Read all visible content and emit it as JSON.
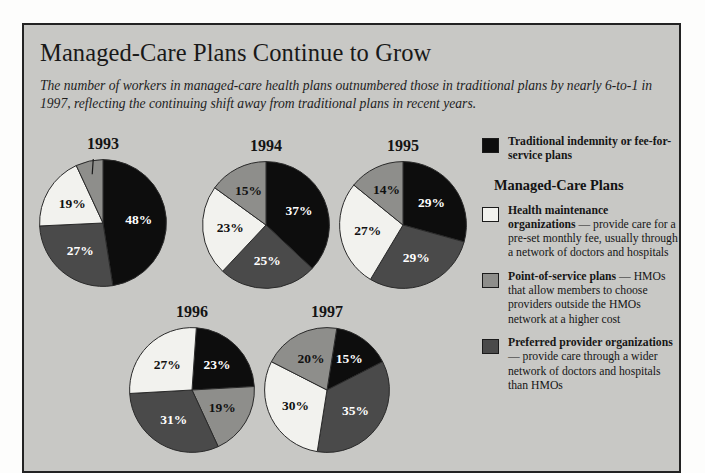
{
  "header": {
    "title": "Managed-Care Plans Continue to Grow",
    "subtitle": "The number of workers in managed-care health plans outnumbered those in traditional plans by nearly 6-to-1 in 1997, reflecting the continuing shift away from traditional plans in recent years."
  },
  "colors": {
    "background": "#c8c8c5",
    "frame_border": "#232323",
    "traditional": "#0d0d0d",
    "hmo": "#f2f2ee",
    "pos": "#8e8e8b",
    "ppo": "#4a4a4a",
    "label_on_dark": "#ffffff",
    "label_on_light": "#111111"
  },
  "legend": {
    "managed_care_heading": "Managed-Care Plans",
    "items": [
      {
        "key": "traditional",
        "swatch": "#0d0d0d",
        "bold": "Traditional indemnity or fee-for-service plans",
        "rest": ""
      },
      {
        "key": "hmo",
        "swatch": "#f2f2ee",
        "bold": "Health maintenance organizations",
        "rest": " — provide care for a pre-set monthly fee, usually through a network of doctors and hospitals"
      },
      {
        "key": "pos",
        "swatch": "#8e8e8b",
        "bold": "Point-of-service plans",
        "rest": " — HMOs that allow members to choose providers outside the HMOs network at a higher cost"
      },
      {
        "key": "ppo",
        "swatch": "#4a4a4a",
        "bold": "Preferred provider organizations",
        "rest": " — provide care through a wider network of doctors and hospitals than HMOs"
      }
    ]
  },
  "chart_data": {
    "type": "pie",
    "title": "Managed-Care Plans Continue to Grow",
    "subtitle": "The number of workers in managed-care health plans outnumbered those in traditional plans by nearly 6-to-1 in 1997, reflecting the continuing shift away from traditional plans in recent years.",
    "unit": "percent of workers",
    "categories": [
      "Traditional indemnity or fee-for-service plans",
      "Preferred provider organizations",
      "Health maintenance organizations",
      "Point-of-service plans"
    ],
    "category_colors": [
      "#0d0d0d",
      "#4a4a4a",
      "#f2f2ee",
      "#8e8e8b"
    ],
    "charts": [
      {
        "year": "1993",
        "start_angle": 0,
        "slices": [
          {
            "key": "traditional",
            "label": "48%",
            "value": 48,
            "color": "#0d0d0d",
            "label_color": "on-dark",
            "lx": 50.0,
            "ly": 50.0
          },
          {
            "key": "ppo",
            "label": "27%",
            "value": 27,
            "color": "#4a4a4a",
            "label_color": "on-dark",
            "lx": 50.0,
            "ly": 50.0
          },
          {
            "key": "hmo",
            "label": "19%",
            "value": 19,
            "color": "#f2f2ee",
            "label_color": "on-light",
            "lx": 50.0,
            "ly": 50.0
          },
          {
            "key": "pos",
            "label": "7%",
            "value": 7,
            "color": "#8e8e8b",
            "label_color": "on-light",
            "callout": true
          }
        ]
      },
      {
        "year": "1994",
        "start_angle": 0,
        "slices": [
          {
            "key": "traditional",
            "label": "37%",
            "value": 37,
            "color": "#0d0d0d",
            "label_color": "on-dark",
            "lx": 50.0,
            "ly": 50.0
          },
          {
            "key": "ppo",
            "label": "25%",
            "value": 25,
            "color": "#4a4a4a",
            "label_color": "on-dark",
            "lx": 50.0,
            "ly": 50.0
          },
          {
            "key": "hmo",
            "label": "23%",
            "value": 23,
            "color": "#f2f2ee",
            "label_color": "on-light",
            "lx": 50.0,
            "ly": 50.0
          },
          {
            "key": "pos",
            "label": "15%",
            "value": 15,
            "color": "#8e8e8b",
            "label_color": "on-light",
            "lx": 50.0,
            "ly": 50.0
          }
        ]
      },
      {
        "year": "1995",
        "start_angle": 0,
        "slices": [
          {
            "key": "traditional",
            "label": "29%",
            "value": 29,
            "color": "#0d0d0d",
            "label_color": "on-dark",
            "lx": 50.0,
            "ly": 50.0
          },
          {
            "key": "ppo",
            "label": "29%",
            "value": 29,
            "color": "#4a4a4a",
            "label_color": "on-dark",
            "lx": 50.0,
            "ly": 50.0
          },
          {
            "key": "hmo",
            "label": "27%",
            "value": 27,
            "color": "#f2f2ee",
            "label_color": "on-light",
            "lx": 50.0,
            "ly": 50.0
          },
          {
            "key": "pos",
            "label": "14%",
            "value": 14,
            "color": "#8e8e8b",
            "label_color": "on-light",
            "lx": 50.0,
            "ly": 50.0
          }
        ]
      },
      {
        "year": "1996",
        "start_angle": 4,
        "slices": [
          {
            "key": "traditional",
            "label": "23%",
            "value": 23,
            "color": "#0d0d0d",
            "label_color": "on-dark",
            "lx": 50.0,
            "ly": 50.0
          },
          {
            "key": "pos",
            "label": "19%",
            "value": 19,
            "color": "#8e8e8b",
            "label_color": "on-light",
            "lx": 50.0,
            "ly": 50.0
          },
          {
            "key": "ppo",
            "label": "31%",
            "value": 31,
            "color": "#4a4a4a",
            "label_color": "on-dark",
            "lx": 50.0,
            "ly": 50.0
          },
          {
            "key": "hmo",
            "label": "27%",
            "value": 27,
            "color": "#f2f2ee",
            "label_color": "on-light",
            "lx": 50.0,
            "ly": 50.0
          }
        ]
      },
      {
        "year": "1997",
        "start_angle": 9,
        "slices": [
          {
            "key": "traditional",
            "label": "15%",
            "value": 15,
            "color": "#0d0d0d",
            "label_color": "on-dark",
            "lx": 50.0,
            "ly": 50.0
          },
          {
            "key": "ppo",
            "label": "35%",
            "value": 35,
            "color": "#4a4a4a",
            "label_color": "on-dark",
            "lx": 50.0,
            "ly": 50.0
          },
          {
            "key": "hmo",
            "label": "30%",
            "value": 30,
            "color": "#f2f2ee",
            "label_color": "on-light",
            "lx": 50.0,
            "ly": 50.0
          },
          {
            "key": "pos",
            "label": "20%",
            "value": 20,
            "color": "#8e8e8b",
            "label_color": "on-light",
            "lx": 50.0,
            "ly": 50.0
          }
        ]
      }
    ],
    "layout": [
      {
        "year": "1993",
        "left": 15,
        "top": 110,
        "size": 128
      },
      {
        "year": "1994",
        "left": 178,
        "top": 112,
        "size": 128
      },
      {
        "year": "1995",
        "left": 315,
        "top": 112,
        "size": 128
      },
      {
        "year": "1996",
        "left": 105,
        "top": 278,
        "size": 126
      },
      {
        "year": "1997",
        "left": 240,
        "top": 278,
        "size": 126
      }
    ]
  }
}
